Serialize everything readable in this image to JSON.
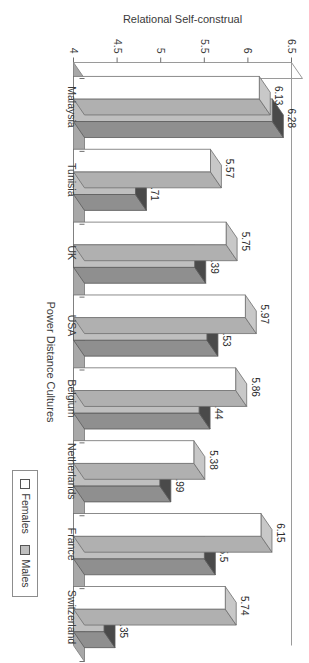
{
  "chart_data": {
    "type": "bar",
    "title": "",
    "subtitle": "",
    "xlabel": "Power Distance Cultures",
    "ylabel": "Relational Self-construal",
    "categories": [
      "Malaysia",
      "Tunisia",
      "UK",
      "USA",
      "Belgium",
      "Netherlands",
      "France",
      "Switzerland"
    ],
    "series": [
      {
        "name": "Females",
        "values": [
          6.13,
          5.57,
          5.75,
          5.97,
          5.86,
          5.38,
          6.15,
          5.74
        ],
        "color": "#ffffff",
        "top_face_color": "#c8c8c8",
        "side_face_color": "#b0b0b0",
        "outline_color": "#6f6f6f"
      },
      {
        "name": "Males",
        "values": [
          6.28,
          4.71,
          5.39,
          5.53,
          5.44,
          4.99,
          5.5,
          4.35
        ],
        "color": "#bfbfbf",
        "top_face_color": "#4a4a4a",
        "side_face_color": "#8f8f8f",
        "outline_color": "#5a5a5a"
      }
    ],
    "ylim": [
      4,
      6.5
    ],
    "yticks": [
      "6.5",
      "6",
      "5.5",
      "5",
      "4.5",
      "4"
    ],
    "ytick_values": [
      6.5,
      6.0,
      5.5,
      5.0,
      4.5,
      4.0
    ],
    "grid": false,
    "legend_position": "top-left",
    "three_d": true,
    "orientation": "rotated-90-ccw",
    "bar_orientation": "vertical-in-unrotated-space",
    "value_labels_shown": true
  },
  "legend": {
    "entries": [
      {
        "label": "Females",
        "swatch": "white-swatch"
      },
      {
        "label": "Males",
        "swatch": "gray-swatch"
      }
    ]
  },
  "axes": {
    "value_axis_title": "Relational Self-construal",
    "category_axis_title": "Power Distance Cultures"
  }
}
